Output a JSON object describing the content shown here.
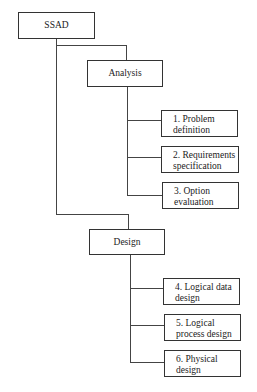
{
  "diagram": {
    "root": {
      "label": "SSAD"
    },
    "phases": [
      {
        "label": "Analysis",
        "steps": [
          {
            "line1": "1. Problem",
            "line2": "definition"
          },
          {
            "line1": "2. Requirements",
            "line2": "specification"
          },
          {
            "line1": "3. Option",
            "line2": "evaluation"
          }
        ]
      },
      {
        "label": "Design",
        "steps": [
          {
            "line1": "4. Logical data",
            "line2": "design"
          },
          {
            "line1": "5. Logical",
            "line2": "process design"
          },
          {
            "line1": "6. Physical",
            "line2": "design"
          }
        ]
      }
    ]
  }
}
